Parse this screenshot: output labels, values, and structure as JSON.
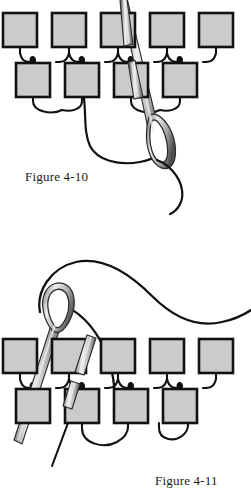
{
  "page": {
    "background_color": "#ffffff",
    "width": 251,
    "height": 487
  },
  "colors": {
    "bead_fill": "#cbcbcb",
    "bead_stroke": "#111111",
    "thread_stroke": "#111111",
    "needle_light": "#f2f2f2",
    "needle_mid": "#b9b9b9",
    "needle_dark": "#5e5e5e",
    "caption_text": "#1a1a1a"
  },
  "figures": [
    {
      "id": "figure-4-10",
      "caption": "Figure 4-10",
      "description": "Brick stitch diagram: needle passes down through a bead in the upper row, thread loops below",
      "needle": {
        "name": "sewing-needle",
        "orientation": "pointing-up-left",
        "tip": {
          "x": 121,
          "y": 0
        },
        "eye": {
          "x": 153,
          "y": 136
        }
      },
      "rows": [
        {
          "name": "bead-row-top",
          "y": 13,
          "bead_width": 34,
          "bead_height": 34,
          "beads": [
            {
              "label": "bead-1",
              "x": 3
            },
            {
              "label": "bead-2",
              "x": 52
            },
            {
              "label": "bead-3",
              "x": 101
            },
            {
              "label": "bead-4",
              "x": 150
            },
            {
              "label": "bead-5",
              "x": 199
            }
          ]
        },
        {
          "name": "bead-row-bottom",
          "y": 63,
          "bead_width": 34,
          "bead_height": 34,
          "beads": [
            {
              "label": "bead-1",
              "x": 16
            },
            {
              "label": "bead-2",
              "x": 65
            },
            {
              "label": "bead-3",
              "x": 114
            },
            {
              "label": "bead-4",
              "x": 163
            }
          ]
        }
      ],
      "thread_tail": {
        "name": "thread-tail-loop",
        "description": "long loop from row two trailing down past the needle eye and curling right"
      }
    },
    {
      "id": "figure-4-11",
      "caption": "Figure 4-11",
      "description": "Brick stitch diagram: needle emerges upward, working thread arcs over the top to the right",
      "needle": {
        "name": "sewing-needle",
        "orientation": "pointing-up-right",
        "tip": {
          "x": 17,
          "y": 193
        },
        "eye": {
          "x": 48,
          "y": 57
        }
      },
      "rows": [
        {
          "name": "bead-row-top",
          "y": 95,
          "bead_width": 34,
          "bead_height": 34,
          "beads": [
            {
              "label": "bead-1",
              "x": 3
            },
            {
              "label": "bead-2",
              "x": 52
            },
            {
              "label": "bead-3",
              "x": 101
            },
            {
              "label": "bead-4",
              "x": 150
            },
            {
              "label": "bead-5",
              "x": 199
            }
          ]
        },
        {
          "name": "bead-row-bottom",
          "y": 145,
          "bead_width": 34,
          "bead_height": 34,
          "beads": [
            {
              "label": "bead-1",
              "x": 16
            },
            {
              "label": "bead-2",
              "x": 65
            },
            {
              "label": "bead-3",
              "x": 114
            },
            {
              "label": "bead-4",
              "x": 163
            }
          ]
        }
      ],
      "thread_tail": {
        "name": "thread-tail-loop",
        "description": "thread sweeps from the needle eye up and over to the right edge; a short tail exits bottom-left"
      }
    }
  ]
}
